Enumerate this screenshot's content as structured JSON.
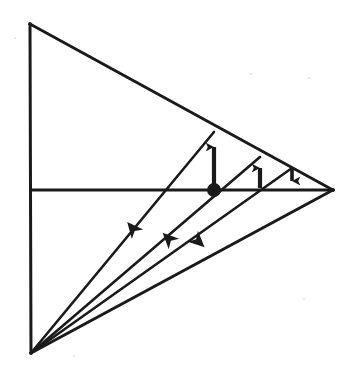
{
  "figure": {
    "type": "geometric-line-diagram",
    "canvas": {
      "width": 348,
      "height": 385,
      "background": "#ffffff"
    },
    "stroke_color": "#1a1a1a",
    "fill_color": "#1a1a1a",
    "stroke_width": 2.6
  },
  "points": {
    "top_apex": {
      "name": "top-apex",
      "x": 30,
      "y": 24
    },
    "bottom_apex": {
      "name": "bottom-apex",
      "x": 31,
      "y": 353
    },
    "right_vertex": {
      "name": "right-vertex",
      "x": 333,
      "y": 190
    },
    "mid_left": {
      "name": "mid-left",
      "x": 31,
      "y": 190
    },
    "center_node": {
      "name": "center-node",
      "x": 214,
      "y": 190
    },
    "node_two": {
      "name": "node-two",
      "x": 260,
      "y": 190
    },
    "node_three": {
      "name": "node-three",
      "x": 292,
      "y": 190
    },
    "hyp_point_one": {
      "name": "hypotenuse-point-one",
      "x": 214,
      "y": 132
    },
    "hyp_point_two": {
      "name": "hypotenuse-point-two",
      "x": 260,
      "y": 157
    },
    "hyp_point_three": {
      "name": "hypotenuse-point-three",
      "x": 292,
      "y": 168
    }
  },
  "edges": [
    {
      "name": "vertical-left-edge",
      "x1": 30,
      "y1": 24,
      "x2": 31,
      "y2": 353
    },
    {
      "name": "upper-hypotenuse",
      "x1": 30,
      "y1": 24,
      "x2": 333,
      "y2": 190
    },
    {
      "name": "lower-hypotenuse",
      "x1": 31,
      "y1": 353,
      "x2": 333,
      "y2": 190
    },
    {
      "name": "horizontal-median",
      "x1": 31,
      "y1": 190,
      "x2": 333,
      "y2": 190
    }
  ],
  "cevians": [
    {
      "name": "cevian-one",
      "x1": 31,
      "y1": 353,
      "x2": 214,
      "y2": 132
    },
    {
      "name": "cevian-two",
      "x1": 31,
      "y1": 353,
      "x2": 260,
      "y2": 157
    },
    {
      "name": "cevian-three",
      "x1": 31,
      "y1": 353,
      "x2": 292,
      "y2": 168
    }
  ],
  "vertical_arrows": [
    {
      "name": "vertical-arrow-one",
      "direction": "up",
      "x": 214,
      "tail_y": 188,
      "head_y": 139
    },
    {
      "name": "vertical-arrow-two",
      "direction": "up",
      "x": 260,
      "tail_y": 188,
      "head_y": 160
    },
    {
      "name": "vertical-arrow-three",
      "direction": "down",
      "x": 292,
      "tail_y": 169,
      "head_y": 189
    }
  ],
  "diagonal_arrowheads": [
    {
      "name": "diagonal-arrowhead-one",
      "direction": "down-left",
      "x": 133,
      "y": 229,
      "angle_deg": 230
    },
    {
      "name": "diagonal-arrowhead-two",
      "direction": "down-left",
      "x": 169,
      "y": 239,
      "angle_deg": 225
    },
    {
      "name": "diagonal-arrowhead-three",
      "direction": "up-right",
      "x": 198,
      "y": 241,
      "angle_deg": 43
    }
  ],
  "center_dot": {
    "name": "center-dot",
    "x": 214,
    "y": 190,
    "radius": 7
  },
  "specks": [
    {
      "x": 250,
      "y": 73,
      "d": 2
    },
    {
      "x": 308,
      "y": 77,
      "d": 2
    },
    {
      "x": 14,
      "y": 37,
      "d": 2
    },
    {
      "x": 303,
      "y": 298,
      "d": 2
    },
    {
      "x": 73,
      "y": 355,
      "d": 2
    }
  ]
}
